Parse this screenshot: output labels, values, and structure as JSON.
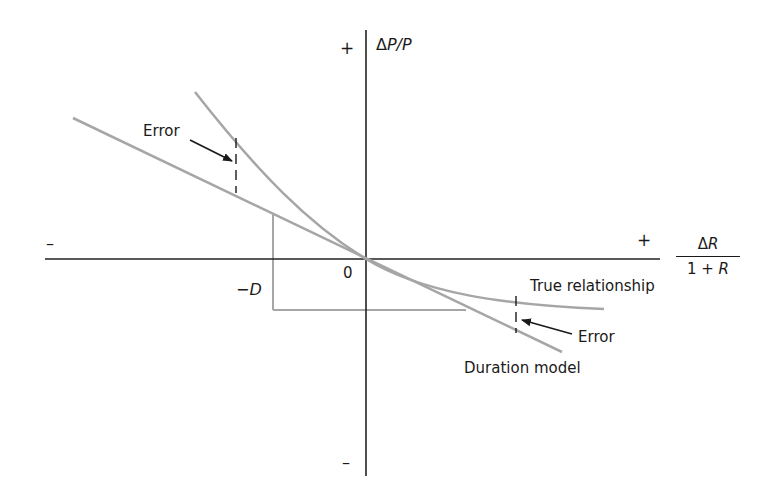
{
  "figure": {
    "axes": {
      "y_label": "ΔP/P",
      "y_label_delta": "Δ",
      "y_label_rest": "P/P",
      "y_plus": "+",
      "y_minus": "–",
      "x_plus": "+",
      "x_minus": "–",
      "x_label_numerator_delta": "Δ",
      "x_label_numerator_var": "R",
      "x_label_denominator": "1 + ",
      "x_label_denominator_var": "R",
      "origin": "0"
    },
    "labels": {
      "neg_duration": "−",
      "neg_duration_var": "D",
      "error_left": "Error",
      "error_right": "Error",
      "true_relationship": "True relationship",
      "duration_model": "Duration model"
    },
    "colors": {
      "curve": "#a6a6a6",
      "axis": "#222222",
      "text": "#1a1a1a",
      "background": "#ffffff"
    }
  }
}
